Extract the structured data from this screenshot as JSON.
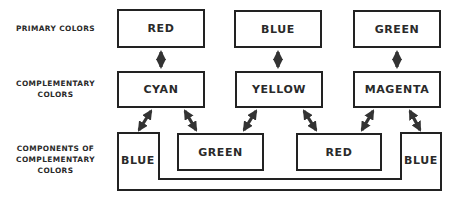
{
  "row_labels": {
    "primary": [
      "PRIMARY COLORS"
    ],
    "complementary": [
      "COMPLEMENTARY",
      "COLORS"
    ],
    "components": [
      "COMPONENTS OF",
      "COMPLEMENTARY",
      "COLORS"
    ]
  },
  "primary_colors": [
    {
      "label": "RED"
    },
    {
      "label": "BLUE"
    },
    {
      "label": "GREEN"
    }
  ],
  "complementary_colors": [
    {
      "label": "CYAN"
    },
    {
      "label": "YELLOW"
    },
    {
      "label": "MAGENTA"
    }
  ],
  "components": {
    "left": {
      "label": "BLUE"
    },
    "middle_left": {
      "label": "GREEN"
    },
    "middle_right": {
      "label": "RED"
    },
    "right": {
      "label": "BLUE"
    }
  },
  "colors": {
    "stroke": "#222222",
    "text": "#2a2a2a",
    "background": "#ffffff"
  }
}
